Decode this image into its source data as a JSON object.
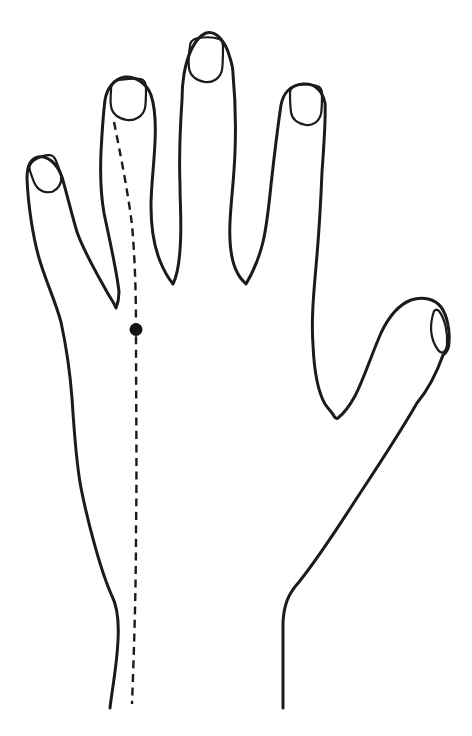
{
  "figure": {
    "type": "line-drawing",
    "background_color": "#ffffff",
    "line_color": "#1b1b1b",
    "marker": {
      "shape": "filled-circle",
      "color": "#141414",
      "cx": 136,
      "cy": 329.5,
      "radius": 6.5
    },
    "meridian": {
      "style": "dashed",
      "dash_pattern": "8 5.5",
      "from": "ring-fingertip",
      "to": "wrist"
    },
    "elements": [
      "hand-outline",
      "pinky-nail",
      "ring-nail",
      "middle-nail",
      "index-nail",
      "thumb-nail",
      "meridian-dashed-line",
      "acupoint-dot"
    ]
  }
}
